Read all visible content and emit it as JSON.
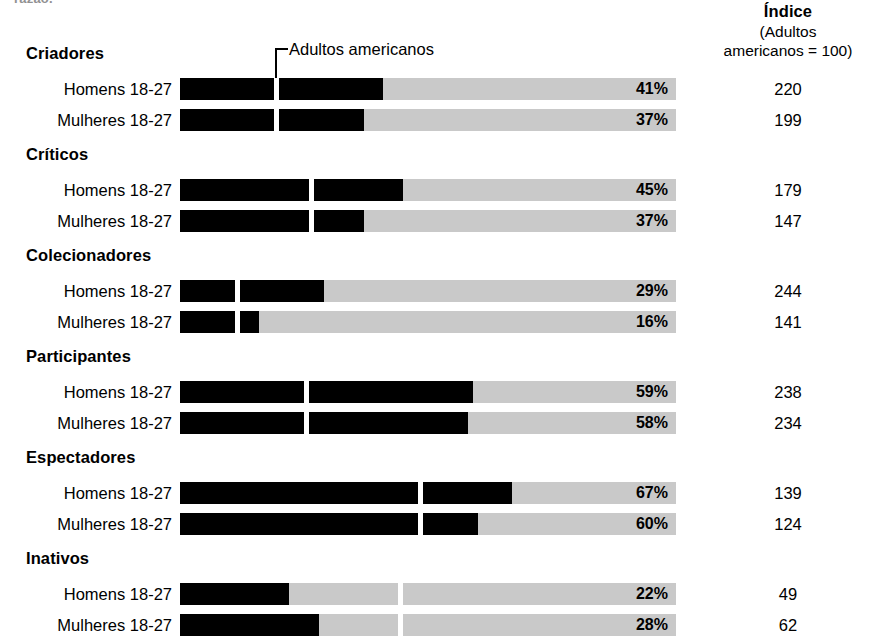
{
  "clipped_top_text": "razão.",
  "index_header": {
    "main": "Índice",
    "line2": "(Adultos",
    "line3": "americanos = 100)"
  },
  "benchmark_label": "Adultos americanos",
  "chart_data": {
    "type": "bar",
    "orientation": "horizontal",
    "title": "",
    "xlabel": "",
    "ylabel": "",
    "xlim": [
      0,
      100
    ],
    "grid": false,
    "legend": "none",
    "track_color": "#c9c9c9",
    "bar_color": "#000000",
    "marker_color": "#ffffff",
    "benchmark_label": "Adultos americanos",
    "value_suffix": "%",
    "index_column_header": "Índice (Adultos americanos = 100)",
    "groups": [
      {
        "name": "Criadores",
        "benchmark": 19,
        "rows": [
          {
            "label": "Homens 18-27",
            "value": 41,
            "display": "41%",
            "index": 220
          },
          {
            "label": "Mulheres 18-27",
            "value": 37,
            "display": "37%",
            "index": 199
          }
        ]
      },
      {
        "name": "Críticos",
        "benchmark": 26,
        "rows": [
          {
            "label": "Homens 18-27",
            "value": 45,
            "display": "45%",
            "index": 179
          },
          {
            "label": "Mulheres 18-27",
            "value": 37,
            "display": "37%",
            "index": 147
          }
        ]
      },
      {
        "name": "Colecionadores",
        "benchmark": 11,
        "rows": [
          {
            "label": "Homens 18-27",
            "value": 29,
            "display": "29%",
            "index": 244
          },
          {
            "label": "Mulheres 18-27",
            "value": 16,
            "display": "16%",
            "index": 141
          }
        ]
      },
      {
        "name": "Participantes",
        "benchmark": 25,
        "rows": [
          {
            "label": "Homens 18-27",
            "value": 59,
            "display": "59%",
            "index": 238
          },
          {
            "label": "Mulheres 18-27",
            "value": 58,
            "display": "58%",
            "index": 234
          }
        ]
      },
      {
        "name": "Espectadores",
        "benchmark": 48,
        "rows": [
          {
            "label": "Homens 18-27",
            "value": 67,
            "display": "67%",
            "index": 139
          },
          {
            "label": "Mulheres 18-27",
            "value": 60,
            "display": "60%",
            "index": 124
          }
        ]
      },
      {
        "name": "Inativos",
        "benchmark": 44,
        "rows": [
          {
            "label": "Homens 18-27",
            "value": 22,
            "display": "22%",
            "index": 49
          },
          {
            "label": "Mulheres 18-27",
            "value": 28,
            "display": "28%",
            "index": 62
          }
        ]
      }
    ]
  }
}
